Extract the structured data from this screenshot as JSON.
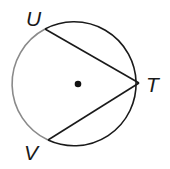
{
  "diagram": {
    "type": "circle-with-inscribed-angle",
    "points": {
      "U": {
        "label": "U"
      },
      "T": {
        "label": "T"
      },
      "V": {
        "label": "V"
      }
    },
    "segments": [
      "UT",
      "VT"
    ],
    "center_marked": true,
    "highlighted_arc": "UV",
    "colors": {
      "stroke": "#1a1a1a",
      "arc_highlight": "#8a8a8a"
    }
  }
}
